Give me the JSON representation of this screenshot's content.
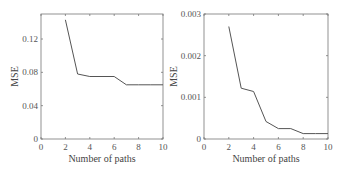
{
  "chart_data": [
    {
      "type": "line",
      "title": "",
      "xlabel": "Number of paths",
      "ylabel": "MSE",
      "xlim": [
        0,
        10
      ],
      "ylim": [
        0,
        0.15
      ],
      "xticks": [
        0,
        2,
        4,
        6,
        8,
        10
      ],
      "xtick_labels": [
        "0",
        "2",
        "4",
        "6",
        "8",
        "10"
      ],
      "yticks": [
        0,
        0.04,
        0.08,
        0.12
      ],
      "ytick_labels": [
        "0",
        "0.04",
        "0.08",
        "0.12"
      ],
      "grid": false,
      "legend": null,
      "series": [
        {
          "name": "MSE",
          "x": [
            2,
            3,
            4,
            5,
            6,
            7,
            8,
            9,
            10
          ],
          "values": [
            0.143,
            0.078,
            0.075,
            0.075,
            0.075,
            0.065,
            0.065,
            0.065,
            0.065
          ]
        }
      ]
    },
    {
      "type": "line",
      "title": "",
      "xlabel": "Number of paths",
      "ylabel": "MSE",
      "xlim": [
        0,
        10
      ],
      "ylim": [
        0,
        0.003
      ],
      "xticks": [
        0,
        2,
        4,
        6,
        8,
        10
      ],
      "xtick_labels": [
        "0",
        "2",
        "4",
        "6",
        "8",
        "10"
      ],
      "yticks": [
        0,
        0.001,
        0.002,
        0.003
      ],
      "ytick_labels": [
        "0",
        "0.001",
        "0.002",
        "0.003"
      ],
      "grid": false,
      "legend": null,
      "series": [
        {
          "name": "MSE",
          "x": [
            2,
            3,
            4,
            5,
            6,
            7,
            8,
            9,
            10
          ],
          "values": [
            0.0027,
            0.00122,
            0.00114,
            0.00042,
            0.00025,
            0.00025,
            0.00013,
            0.00013,
            0.00013
          ]
        }
      ]
    }
  ],
  "style": {
    "line_color": "#555555",
    "axis_color": "#777777"
  }
}
